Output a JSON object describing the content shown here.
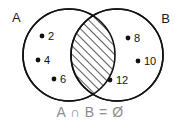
{
  "diagram": {
    "type": "venn",
    "title": "",
    "caption": "A ∩ B = Ø",
    "background_color": "#ffffff",
    "stroke_color": "#111111",
    "caption_color": "#8c8c8c",
    "sets": [
      {
        "id": "A",
        "label": "A",
        "label_position": "top-left",
        "elements": [
          "2",
          "4",
          "6"
        ]
      },
      {
        "id": "B",
        "label": "B",
        "label_position": "top-right",
        "elements": [
          "8",
          "10",
          "12"
        ]
      }
    ],
    "intersection": {
      "label": "",
      "elements": [],
      "fill_style": "diagonal-hatch",
      "hatch_color": "#111111"
    }
  }
}
